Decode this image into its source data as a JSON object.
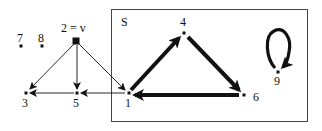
{
  "diagram": {
    "set_label": "S",
    "colors": {
      "ink": "#111111",
      "box": "#444444",
      "background": "#ffffff"
    },
    "nodes": [
      {
        "id": "1",
        "label": "1",
        "x": 129,
        "y": 93,
        "in_set": true
      },
      {
        "id": "2",
        "label": "2 = v",
        "x": 76,
        "y": 41,
        "in_set": false,
        "highlighted": true
      },
      {
        "id": "3",
        "label": "3",
        "x": 26,
        "y": 93,
        "in_set": false
      },
      {
        "id": "4",
        "label": "4",
        "x": 184,
        "y": 33,
        "in_set": true
      },
      {
        "id": "5",
        "label": "5",
        "x": 77,
        "y": 93,
        "in_set": false
      },
      {
        "id": "6",
        "label": "6",
        "x": 244,
        "y": 95,
        "in_set": true
      },
      {
        "id": "7",
        "label": "7",
        "x": 21,
        "y": 46,
        "in_set": false
      },
      {
        "id": "8",
        "label": "8",
        "x": 42,
        "y": 46,
        "in_set": false
      },
      {
        "id": "9",
        "label": "9",
        "x": 278,
        "y": 72,
        "in_set": true
      }
    ],
    "edges": [
      {
        "from": "2",
        "to": "3",
        "weight": "thin"
      },
      {
        "from": "2",
        "to": "5",
        "weight": "thin"
      },
      {
        "from": "2",
        "to": "1",
        "weight": "thin"
      },
      {
        "from": "5",
        "to": "3",
        "weight": "thin"
      },
      {
        "from": "1",
        "to": "5",
        "weight": "thin"
      },
      {
        "from": "1",
        "to": "4",
        "weight": "thick"
      },
      {
        "from": "4",
        "to": "6",
        "weight": "thick"
      },
      {
        "from": "6",
        "to": "1",
        "weight": "thick"
      },
      {
        "from": "9",
        "to": "9",
        "weight": "thick",
        "type": "self-loop"
      }
    ]
  }
}
